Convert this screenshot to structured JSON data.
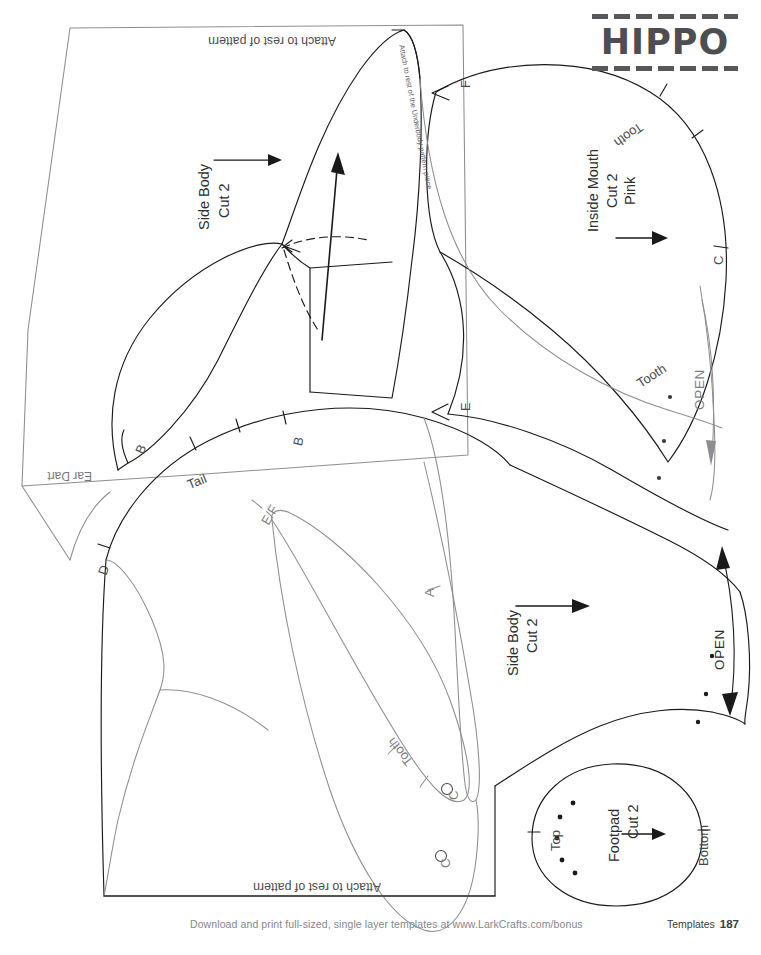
{
  "page": {
    "title": "HIPPO",
    "background_color": "#ffffff",
    "ink_color": "#1a1a1a",
    "gray_ink_color": "#808084",
    "title_color": "#4e4e50"
  },
  "footer": {
    "note": "Download and print full-sized, single layer templates at www.LarkCrafts.com/bonus",
    "section": "Templates",
    "page_number": "187"
  },
  "pieces": {
    "side_body_top": {
      "name": "Side Body",
      "cut": "Cut 2",
      "attach_note": "Attach to rest of pattern",
      "underbody_note": "Attach to rest of the Underbody pattern piece",
      "ear_dart": "Ear Dart"
    },
    "inside_mouth": {
      "name": "Inside Mouth",
      "cut": "Cut 2",
      "fabric": "Pink",
      "open": "OPEN"
    },
    "side_body_bottom": {
      "name": "Side Body",
      "cut": "Cut 2",
      "attach_note": "Attach to rest of pattern",
      "open": "OPEN"
    },
    "footpad": {
      "name": "Footpad",
      "cut": "Cut 2",
      "top": "Top",
      "bottom": "Bottom"
    }
  },
  "notches": {
    "f_top": "F",
    "tooth_mouth_upper": "Tooth",
    "c_mouth": "C",
    "e_mouth": "E",
    "tooth_mouth_lower": "Tooth",
    "b_ear": "B",
    "b_body": "B",
    "tail": "Tail",
    "d_body": "D",
    "ef_inner": "E/F",
    "a_body": "A",
    "tooth_inner": "Tooth",
    "c_inner": "C",
    "c_bottom": "C"
  }
}
